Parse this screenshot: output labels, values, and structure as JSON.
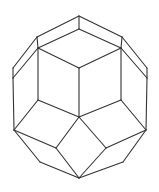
{
  "figure": {
    "title": "",
    "stroke_color": "#333333",
    "background": "#ffffff",
    "vertices": {
      "T": [
        79,
        16
      ],
      "UL": [
        37,
        37
      ],
      "UR": [
        122,
        37
      ],
      "IT": [
        79,
        29
      ],
      "IL": [
        38,
        48
      ],
      "IR": [
        121,
        48
      ],
      "LT": [
        13,
        68
      ],
      "LB": [
        13,
        78
      ],
      "RT": [
        147,
        68
      ],
      "RB": [
        147,
        78
      ],
      "C": [
        79,
        68
      ],
      "CB": [
        79,
        117
      ],
      "ML": [
        38,
        100
      ],
      "MR": [
        121,
        100
      ],
      "OL": [
        14,
        130
      ],
      "OR": [
        146,
        130
      ],
      "LM": [
        56,
        148
      ],
      "RM": [
        106,
        148
      ],
      "BL": [
        40,
        162
      ],
      "BR": [
        123,
        162
      ],
      "B": [
        79,
        178
      ]
    },
    "edges": [
      [
        "T",
        "UL"
      ],
      [
        "T",
        "UR"
      ],
      [
        "T",
        "IT"
      ],
      [
        "UL",
        "IL"
      ],
      [
        "UR",
        "IR"
      ],
      [
        "IT",
        "IL"
      ],
      [
        "IT",
        "IR"
      ],
      [
        "UL",
        "LT"
      ],
      [
        "UR",
        "RT"
      ],
      [
        "IL",
        "LB"
      ],
      [
        "IR",
        "RB"
      ],
      [
        "LT",
        "LB"
      ],
      [
        "RT",
        "RB"
      ],
      [
        "IL",
        "C"
      ],
      [
        "IR",
        "C"
      ],
      [
        "C",
        "CB"
      ],
      [
        "IL",
        "ML"
      ],
      [
        "IR",
        "MR"
      ],
      [
        "ML",
        "CB"
      ],
      [
        "MR",
        "CB"
      ],
      [
        "LB",
        "OL"
      ],
      [
        "RB",
        "OR"
      ],
      [
        "ML",
        "OL"
      ],
      [
        "MR",
        "OR"
      ],
      [
        "OL",
        "LM"
      ],
      [
        "OR",
        "RM"
      ],
      [
        "LM",
        "CB"
      ],
      [
        "RM",
        "CB"
      ],
      [
        "OL",
        "BL"
      ],
      [
        "OR",
        "BR"
      ],
      [
        "BL",
        "B"
      ],
      [
        "BR",
        "B"
      ],
      [
        "LM",
        "B"
      ],
      [
        "RM",
        "B"
      ]
    ]
  }
}
